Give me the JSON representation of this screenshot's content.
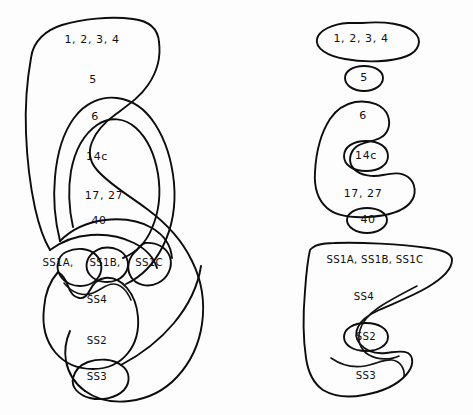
{
  "figure": {
    "background_color": "#fdfdfd",
    "stroke_color": "#0d0d0d",
    "text_color": "#101010",
    "panels": [
      {
        "id": "left-panel",
        "name": "nested-contour-panel-left",
        "labels": [
          {
            "key": "areas_1_2_3_4",
            "text": "1,  2,  3,  4",
            "x": 92,
            "y": 40
          },
          {
            "key": "area_5",
            "text": "5",
            "x": 93,
            "y": 80
          },
          {
            "key": "area_6",
            "text": "6",
            "x": 95,
            "y": 117
          },
          {
            "key": "area_14c",
            "text": "14c",
            "x": 97,
            "y": 157
          },
          {
            "key": "areas_17_27",
            "text": "17,  27",
            "x": 104,
            "y": 196
          },
          {
            "key": "area_40",
            "text": "40",
            "x": 99,
            "y": 221
          },
          {
            "key": "area_ss1a",
            "text": "SS1A,",
            "x": 57,
            "y": 263
          },
          {
            "key": "area_ss1b",
            "text": "SS1B,",
            "x": 102,
            "y": 263
          },
          {
            "key": "area_ss1c",
            "text": "SS1C",
            "x": 146,
            "y": 263
          },
          {
            "key": "area_ss4",
            "text": "SS4",
            "x": 97,
            "y": 300
          },
          {
            "key": "area_ss2",
            "text": "SS2",
            "x": 97,
            "y": 341
          },
          {
            "key": "area_ss3",
            "text": "SS3",
            "x": 97,
            "y": 377
          }
        ]
      },
      {
        "id": "right-panel",
        "name": "nested-contour-panel-right",
        "labels": [
          {
            "key": "areas_1_2_3_4",
            "text": "1,  2,  3,  4",
            "x": 361,
            "y": 39
          },
          {
            "key": "area_5",
            "text": "5",
            "x": 364,
            "y": 78
          },
          {
            "key": "area_6",
            "text": "6",
            "x": 363,
            "y": 116
          },
          {
            "key": "area_14c",
            "text": "14c",
            "x": 366,
            "y": 155
          },
          {
            "key": "areas_17_27",
            "text": "17,  27",
            "x": 363,
            "y": 194
          },
          {
            "key": "area_40",
            "text": "40",
            "x": 368,
            "y": 219
          },
          {
            "key": "areas_ss1abc",
            "text": "SS1A,   SS1B,   SS1C",
            "x": 373,
            "y": 260
          },
          {
            "key": "area_ss4",
            "text": "SS4",
            "x": 364,
            "y": 297
          },
          {
            "key": "area_ss2",
            "text": "SS2",
            "x": 366,
            "y": 337
          },
          {
            "key": "area_ss3",
            "text": "SS3",
            "x": 366,
            "y": 376
          }
        ]
      }
    ],
    "region_names": [
      "1",
      "2",
      "3",
      "4",
      "5",
      "6",
      "14c",
      "17",
      "27",
      "40",
      "SS1A",
      "SS1B",
      "SS1C",
      "SS4",
      "SS2",
      "SS3"
    ]
  }
}
